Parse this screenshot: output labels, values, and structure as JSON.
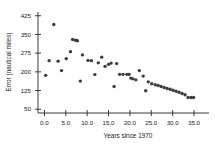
{
  "chart_data": {
    "type": "scatter",
    "title": "",
    "xlabel": "Years since 1970",
    "ylabel": "Error (nautical miles)",
    "xlim": [
      -1.5,
      38.5
    ],
    "ylim": [
      35,
      440
    ],
    "xticks": [
      "0.0",
      "5.0",
      "10.0",
      "15.0",
      "20.0",
      "25.0",
      "30.0",
      "35.0"
    ],
    "xtick_values": [
      0,
      5,
      10,
      15,
      20,
      25,
      30,
      35
    ],
    "yticks": [
      "425",
      "350",
      "275",
      "200",
      "125",
      "50"
    ],
    "ytick_values": [
      425,
      350,
      275,
      200,
      125,
      50
    ],
    "grid": false,
    "legend": null,
    "marker": "filled-circle",
    "marker_color": "#3c3c3c",
    "x": [
      0.3,
      1.1,
      2.2,
      3.2,
      4.0,
      5.1,
      6.1,
      6.6,
      7.3,
      7.7,
      8.4,
      8.9,
      10.2,
      11.0,
      11.8,
      12.6,
      13.4,
      14.2,
      15.0,
      15.6,
      16.3,
      16.9,
      17.6,
      18.4,
      19.3,
      19.8,
      20.2,
      20.7,
      21.4,
      22.2,
      23.1,
      23.7,
      24.3,
      25.1,
      25.9,
      26.6,
      27.3,
      28.0,
      28.7,
      29.4,
      30.1,
      30.8,
      31.5,
      32.2,
      32.9,
      33.6,
      34.3,
      34.9
    ],
    "y": [
      186,
      245,
      390,
      243,
      205,
      253,
      281,
      330,
      327,
      325,
      163,
      268,
      246,
      245,
      189,
      236,
      259,
      222,
      230,
      235,
      141,
      233,
      190,
      190,
      190,
      190,
      175,
      172,
      168,
      205,
      183,
      124,
      160,
      152,
      148,
      145,
      141,
      137,
      133,
      130,
      126,
      122,
      118,
      113,
      108,
      97,
      97,
      97
    ]
  }
}
